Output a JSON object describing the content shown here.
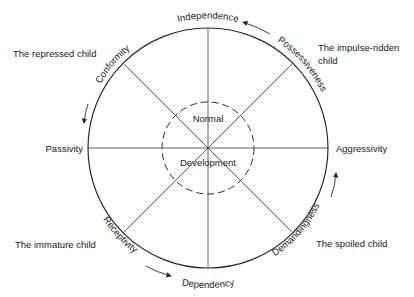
{
  "diagram": {
    "title": "",
    "center_labels": {
      "top": "Normal",
      "bottom": "Development"
    },
    "axes": {
      "top": "Independence",
      "bottom": "Dependency",
      "left": "Passivity",
      "right": "Aggressivity",
      "upper_left": "Conformity",
      "upper_right": "Possessiveness",
      "lower_left": "Receptivity",
      "lower_right": "Demandingness"
    },
    "quadrant_captions": {
      "upper_left": "The repressed child",
      "upper_right_line1": "The impulse-ridden",
      "upper_right_line2": "child",
      "lower_left": "The immature child",
      "lower_right": "The spoiled child"
    },
    "arrows": [
      {
        "position": "upper-right",
        "direction": "counterclockwise toward Independence"
      },
      {
        "position": "left",
        "direction": "downward toward Passivity"
      },
      {
        "position": "lower-left",
        "direction": "rightward toward Dependency"
      },
      {
        "position": "right",
        "direction": "upward toward Aggressivity"
      }
    ],
    "colors": {
      "line": "#2a2a2a",
      "text": "#1a1a1a",
      "background": "#ffffff"
    }
  }
}
